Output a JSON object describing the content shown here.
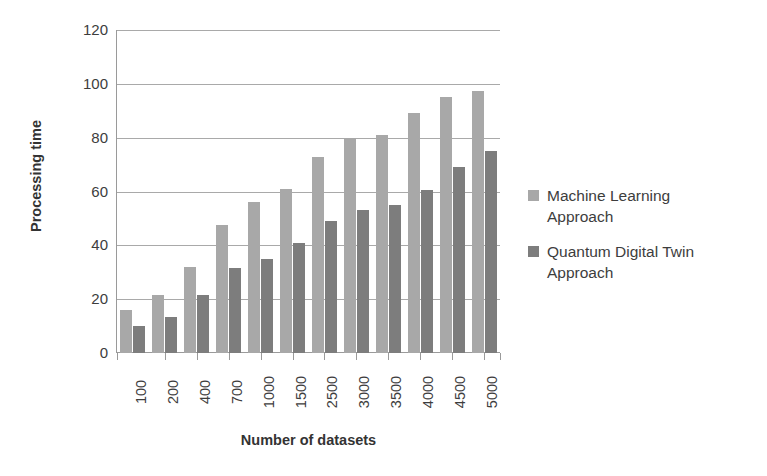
{
  "chart_data": {
    "type": "bar",
    "title": "",
    "xlabel": "Number of datasets",
    "ylabel": "Processing time",
    "categories": [
      "100",
      "200",
      "400",
      "700",
      "1000",
      "1500",
      "2500",
      "3000",
      "3500",
      "4000",
      "4500",
      "5000"
    ],
    "series": [
      {
        "name": "Machine Learning Approach",
        "color": "#a8a8a8",
        "values": [
          16,
          21.5,
          32,
          47.5,
          56,
          61,
          73,
          80,
          81,
          89,
          95,
          97.5
        ]
      },
      {
        "name": "Quantum Digital Twin Approach",
        "color": "#7d7d7d",
        "values": [
          10,
          13.5,
          21.5,
          31.5,
          35,
          41,
          49,
          53,
          55,
          60.5,
          69,
          75
        ]
      }
    ],
    "ylim": [
      0,
      120
    ],
    "yticks": [
      0,
      20,
      40,
      60,
      80,
      100,
      120
    ],
    "ytick_labels": [
      "0",
      "20",
      "40",
      "60",
      "80",
      "100",
      "120"
    ],
    "grid": true,
    "legend_position": "right",
    "background_color": "#ffffff",
    "axis_color": "#9a9a9a",
    "gridline_color": "#a9a9a9"
  }
}
